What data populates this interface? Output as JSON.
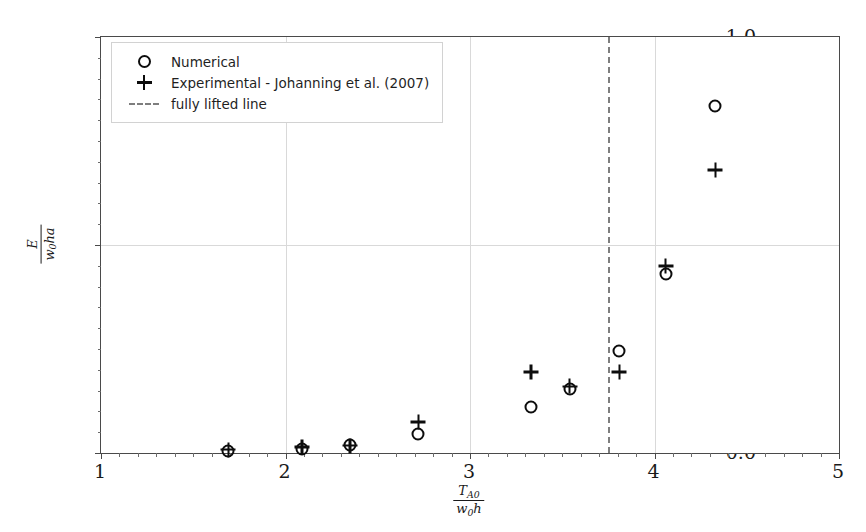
{
  "chart_data": {
    "type": "scatter",
    "title": "",
    "xlabel": "T_A0 / (w_0 h)",
    "ylabel": "E / (w_0 h a)",
    "xlim": [
      1,
      5
    ],
    "ylim": [
      0.0,
      1.0
    ],
    "xticks": [
      1,
      2,
      3,
      4,
      5
    ],
    "yticks": [
      0.0,
      0.5,
      1.0
    ],
    "xtick_labels": [
      "1",
      "2",
      "3",
      "4",
      "5"
    ],
    "ytick_labels": [
      "0.0",
      "0.5",
      "1.0"
    ],
    "grid": true,
    "legend_position": "upper left",
    "series": [
      {
        "name": "Numerical",
        "marker": "circle",
        "color": "#0d0d0d",
        "points": [
          {
            "x": 1.69,
            "y": 0.005
          },
          {
            "x": 2.09,
            "y": 0.01
          },
          {
            "x": 2.35,
            "y": 0.02
          },
          {
            "x": 2.72,
            "y": 0.045
          },
          {
            "x": 3.33,
            "y": 0.11
          },
          {
            "x": 3.54,
            "y": 0.155
          },
          {
            "x": 3.81,
            "y": 0.245
          },
          {
            "x": 4.06,
            "y": 0.43
          },
          {
            "x": 4.33,
            "y": 0.835
          }
        ]
      },
      {
        "name": "Experimental - Johanning et al. (2007)",
        "marker": "plus",
        "color": "#0d0d0d",
        "points": [
          {
            "x": 1.69,
            "y": 0.008
          },
          {
            "x": 2.09,
            "y": 0.014
          },
          {
            "x": 2.35,
            "y": 0.018
          },
          {
            "x": 2.72,
            "y": 0.075
          },
          {
            "x": 3.33,
            "y": 0.195
          },
          {
            "x": 3.54,
            "y": 0.16
          },
          {
            "x": 3.81,
            "y": 0.195
          },
          {
            "x": 4.06,
            "y": 0.45
          },
          {
            "x": 4.33,
            "y": 0.68
          }
        ]
      }
    ],
    "annotations": [
      {
        "name": "fully lifted line",
        "type": "vline",
        "x": 3.75,
        "style": "dashed",
        "color": "#7e7e7e"
      }
    ]
  },
  "legend": {
    "entries": [
      {
        "label": "Numerical",
        "symbol": "circle"
      },
      {
        "label": "Experimental - Johanning et al. (2007)",
        "symbol": "plus"
      },
      {
        "label": "fully lifted line",
        "symbol": "dashed-line"
      }
    ]
  },
  "axis_label_parts": {
    "x_numerator": "T",
    "x_numerator_sub": "A0",
    "x_denominator": "w",
    "x_denominator_sub": "0",
    "x_denominator_tail": "h",
    "y_numerator": "E",
    "y_denominator": "w",
    "y_denominator_sub": "0",
    "y_denominator_tail": "ha"
  }
}
